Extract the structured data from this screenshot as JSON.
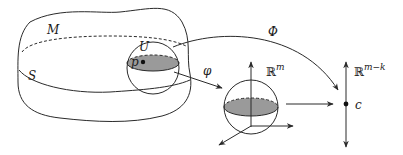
{
  "figure": {
    "labels": {
      "manifold": "M",
      "submanifold": "S",
      "neighborhood": "U",
      "point": "p",
      "map_chart": "φ",
      "map_global": "Φ",
      "euclidean_space_base": "ℝ",
      "euclidean_space_exp": "m",
      "quotient_space_base": "ℝ",
      "quotient_space_exp": "m−k",
      "value": "c"
    },
    "colors": {
      "line": "#2a2a2a",
      "shade": "#9a9a9a",
      "background": "#ffffff"
    }
  }
}
